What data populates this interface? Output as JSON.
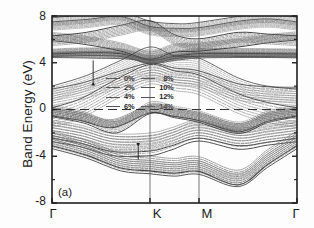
{
  "figure": {
    "panel_label": "(a)",
    "ylabel": "Band Energy (eV)"
  },
  "chart_data": {
    "type": "line",
    "title": "",
    "xlabel": "",
    "ylabel": "Band Energy (eV)",
    "ylim": [
      -8,
      8
    ],
    "yticks": [
      8,
      4,
      0,
      -4,
      -8
    ],
    "ytick_labels": [
      "8",
      "4",
      "0",
      "-4",
      "-8"
    ],
    "xticks": [
      0,
      1,
      1.5,
      2.5
    ],
    "xtick_labels": [
      "Γ",
      "K",
      "M",
      "Γ"
    ],
    "xlim": [
      0,
      2.5
    ],
    "grid": false,
    "vertical_lines_at": [
      "K",
      "M"
    ],
    "fermi_line_at": 0,
    "legend_position": "center",
    "legend_title": "",
    "series": [
      {
        "name": "0%",
        "style": "solid"
      },
      {
        "name": "2%",
        "style": "dashed"
      },
      {
        "name": "4%",
        "style": "dashed"
      },
      {
        "name": "6%",
        "style": "dashed"
      },
      {
        "name": "8%",
        "style": "dashed"
      },
      {
        "name": "10%",
        "style": "dashed"
      },
      {
        "name": "12%",
        "style": "dashed"
      },
      {
        "name": "14%",
        "style": "dashed"
      }
    ],
    "annotations": [
      {
        "type": "arrow",
        "label": "",
        "x": 0.42,
        "y_from": 4.2,
        "y_to": 2.4
      },
      {
        "type": "arrow",
        "label": "",
        "x": 0.88,
        "y_from": -4.3,
        "y_to": -3.2
      }
    ],
    "bands": {
      "note": "Electronic band structure along Γ-K-M-Γ; conduction bands above 0 eV, valence bands below 0 eV; 8 strain curves per band",
      "conduction_top_group_eV": [
        8.0,
        6.3,
        5.9,
        4.8,
        4.5
      ],
      "valence_top_eV": -0.5,
      "valence_min_eV": -6.5
    }
  },
  "legend": {
    "left_column": [
      "0%",
      "2%",
      "4%",
      "6%"
    ],
    "right_column": [
      "8%",
      "10%",
      "12%",
      "14%"
    ]
  },
  "axes": {
    "y_tick_labels": [
      "8",
      "4",
      "0",
      "-4",
      "-8"
    ],
    "x_tick_labels": [
      "Γ",
      "K",
      "M",
      "Γ"
    ]
  }
}
